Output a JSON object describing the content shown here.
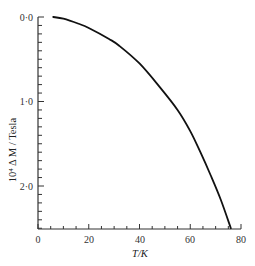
{
  "chart_data": {
    "type": "line",
    "title": "",
    "xlabel": "T/K",
    "ylabel": "10⁴ Δ M / Tesla",
    "xlim": [
      0,
      80
    ],
    "ylim": [
      0,
      2.5
    ],
    "y_inverted": true,
    "x_ticks": [
      "0",
      "20",
      "40",
      "60",
      "80"
    ],
    "y_ticks": [
      "0·0",
      "1·0",
      "2·0"
    ],
    "grid": false,
    "legend": null,
    "series": [
      {
        "name": "ΔM vs T",
        "x": [
          6,
          10,
          16,
          20,
          28,
          32,
          40,
          48,
          55,
          60,
          64,
          68,
          72,
          76
        ],
        "y": [
          0.0,
          0.02,
          0.08,
          0.13,
          0.26,
          0.34,
          0.55,
          0.83,
          1.1,
          1.35,
          1.6,
          1.87,
          2.16,
          2.5
        ]
      }
    ]
  },
  "labels": {
    "x_axis": "T/K",
    "y_axis": "10⁴ Δ M / Tesla",
    "x_tick_0": "0",
    "x_tick_20": "20",
    "x_tick_40": "40",
    "x_tick_60": "60",
    "x_tick_80": "80",
    "y_tick_0": "0·0",
    "y_tick_1": "1·0",
    "y_tick_2": "2·0"
  }
}
